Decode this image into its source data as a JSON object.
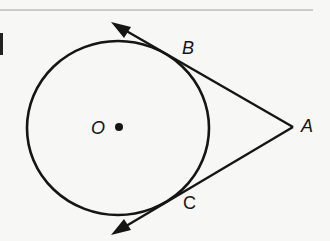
{
  "diagram": {
    "type": "circle-with-two-tangents",
    "colors": {
      "ink": "#151515",
      "background": "#f7f7f5",
      "rule": "#bdbdbd"
    },
    "circle": {
      "center_label": "O",
      "center": [
        118,
        128
      ],
      "radius": 89
    },
    "points": {
      "B": {
        "label": "B",
        "xy": [
          186,
          66
        ]
      },
      "C": {
        "label": "C",
        "xy": [
          186,
          191
        ]
      },
      "A": {
        "label": "A",
        "xy": [
          293,
          127
        ]
      }
    },
    "rays": [
      {
        "from": "A",
        "through": "B",
        "arrow_tip": [
          113,
          23
        ]
      },
      {
        "from": "A",
        "through": "C",
        "arrow_tip": [
          113,
          234
        ]
      }
    ]
  }
}
